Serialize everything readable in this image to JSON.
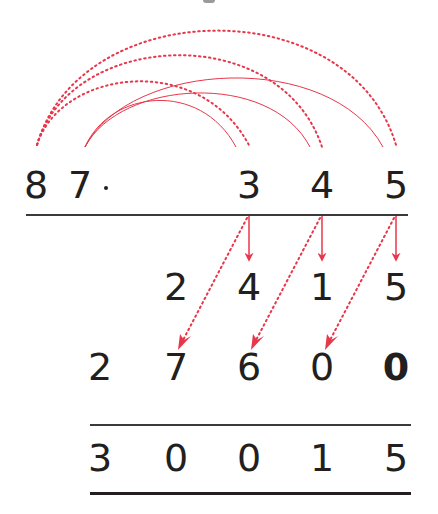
{
  "diagram": {
    "colors": {
      "text": "#231f20",
      "accent": "#e8364a",
      "rule": "#3a3a3a"
    },
    "multiplicand": {
      "digits": [
        "8",
        "7"
      ],
      "operator": "·"
    },
    "multiplier": {
      "digits": [
        "3",
        "4",
        "5"
      ]
    },
    "partial_row_1": {
      "digits": [
        "2",
        "4",
        "1",
        "5"
      ]
    },
    "partial_row_2": {
      "digits": [
        "2",
        "7",
        "6",
        "0",
        "0"
      ],
      "bold_last": true
    },
    "result": {
      "digits": [
        "3",
        "0",
        "0",
        "1",
        "5"
      ]
    },
    "arcs": {
      "from_8_dotted": [
        "8→3",
        "8→4",
        "8→5"
      ],
      "from_7_solid": [
        "7→3",
        "7→4",
        "7→5"
      ]
    },
    "arrows": {
      "straight_down": [
        "3→4",
        "4→1",
        "5→5"
      ],
      "diagonal_dotted": [
        "3→7",
        "4→6",
        "5→0"
      ]
    }
  }
}
